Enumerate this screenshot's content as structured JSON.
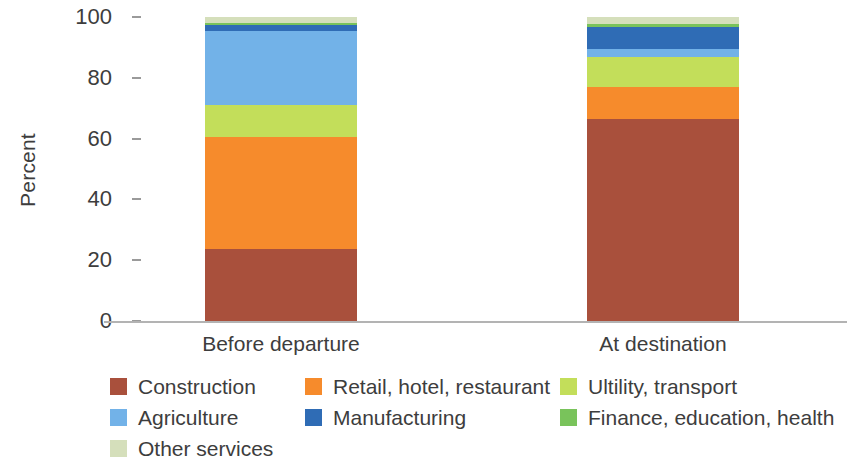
{
  "chart_data": {
    "type": "bar",
    "subtype": "stacked-bar-100pct",
    "title": "",
    "xlabel": "",
    "ylabel": "Percent",
    "ylim": [
      0,
      100
    ],
    "yticks": [
      0,
      20,
      40,
      60,
      80,
      100
    ],
    "ytick_labels": [
      "0",
      "20",
      "40",
      "60",
      "80",
      "100"
    ],
    "grid": false,
    "legend_position": "bottom",
    "categories": [
      "Before departure",
      "At destination"
    ],
    "series": [
      {
        "name": "Construction",
        "color": "#a9503c",
        "values": [
          23.8,
          66.4
        ]
      },
      {
        "name": "Retail, hotel, restaurant",
        "color": "#f68b2c",
        "values": [
          36.7,
          10.6
        ]
      },
      {
        "name": "Ultility, transport",
        "color": "#c3de5a",
        "values": [
          10.5,
          10.0
        ]
      },
      {
        "name": "Agriculture",
        "color": "#72b2e8",
        "values": [
          24.5,
          2.6
        ]
      },
      {
        "name": "Manufacturing",
        "color": "#2f6cb5",
        "values": [
          1.8,
          7.0
        ]
      },
      {
        "name": "Finance, education, health",
        "color": "#79c35b",
        "values": [
          0.7,
          1.2
        ]
      },
      {
        "name": "Other services",
        "color": "#d5dfbb",
        "values": [
          2.0,
          2.2
        ]
      }
    ]
  },
  "axis": {
    "ylabel": "Percent",
    "ytick_labels": [
      "100",
      "80",
      "60",
      "40",
      "20",
      "0"
    ]
  },
  "xaxis": {
    "labels": [
      "Before departure",
      "At destination"
    ]
  },
  "legend": {
    "items": [
      {
        "label": "Construction",
        "color": "#a9503c"
      },
      {
        "label": "Retail, hotel, restaurant",
        "color": "#f68b2c"
      },
      {
        "label": "Ultility, transport",
        "color": "#c3de5a"
      },
      {
        "label": "Agriculture",
        "color": "#72b2e8"
      },
      {
        "label": "Manufacturing",
        "color": "#2f6cb5"
      },
      {
        "label": "Finance, education, health",
        "color": "#79c35b"
      },
      {
        "label": "Other services",
        "color": "#d5dfbb"
      }
    ]
  }
}
